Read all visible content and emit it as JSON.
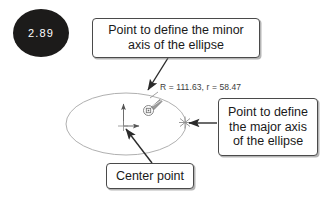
{
  "step": {
    "number": "2.89"
  },
  "drawing": {
    "dimension_readout": "R = 111.63, r = 58.47",
    "ellipse_color": "#b0b0b0",
    "annotation_color": "#4a4a4a",
    "badge_color": "#1c1b1a"
  },
  "callouts": {
    "minor_axis": {
      "line1": "Point to define the minor",
      "line2": "axis of the ellipse"
    },
    "major_axis": {
      "line1": "Point to define",
      "line2": "the major axis",
      "line3": "of the ellipse"
    },
    "center_point": {
      "line1": "Center point"
    }
  }
}
